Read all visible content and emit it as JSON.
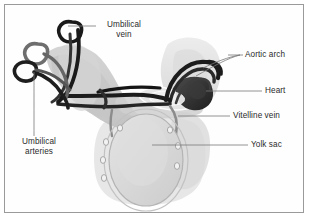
{
  "figure": {
    "border_color": "#9a9a9a",
    "background_color": "#fefefe",
    "text_color": "#2b2b2b"
  },
  "labels": {
    "umbilical_vein": "Umbilical\nvein",
    "aortic_arch": "Aortic arch",
    "heart": "Heart",
    "vitelline_vein": "Vitelline vein",
    "yolk_sac": "Yolk sac",
    "umbilical_arteries": "Umbilical\narteries"
  },
  "structures": {
    "embryo_body": "embryo-body-silhouette",
    "head_region": "head-region-silhouette",
    "yolk_sac_oval": "yolk-sac-oval",
    "yolk_sac_membrane": "yolk-sac-membrane",
    "aortic_arches": "aortic-arch-vessels",
    "heart_mass": "heart-mass",
    "umbilical_vein_vessel": "umbilical-vein-vessel",
    "umbilical_artery_vessels": "umbilical-artery-vessels",
    "vitelline_vein_vessel": "vitelline-vein-vessel",
    "vessel_nodes_count": 7
  },
  "colors": {
    "vessel_dark": "#1c1c1c",
    "vessel_mid": "#6b6b6b",
    "tissue_light": "#d8d8d8",
    "tissue_mid": "#bdbdbd",
    "tissue_pale": "#e8e8e8",
    "leader_line": "#7a7a7a"
  }
}
